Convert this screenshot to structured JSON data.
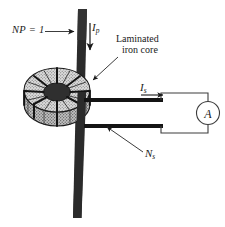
{
  "figure": {
    "background_color": "#ffffff",
    "ink_color": "#1a1a1a",
    "conductor_color": "#2b2b2b",
    "core_fill_color": "#d9d9d9",
    "width": 225,
    "height": 227
  },
  "labels": {
    "primary_turns": {
      "text": "NP = 1",
      "note": "number of primary turns, points to vertical primary conductor"
    },
    "primary_current": {
      "symbol": "I",
      "subscript": "p",
      "note": "primary current, downward arrow along the bar"
    },
    "core": {
      "line1": "Laminated",
      "line2": "iron core",
      "note": "leader arrow to top of toroid"
    },
    "secondary_current": {
      "symbol": "I",
      "subscript": "s",
      "note": "secondary current, rightward arrow on upper lead"
    },
    "secondary_turns": {
      "symbol": "N",
      "subscript": "s",
      "note": "secondary winding turns, leader arrow to toroid"
    },
    "ammeter": {
      "text": "A",
      "note": "ammeter symbol, circled italic A"
    }
  },
  "icons": {
    "arrow_primary": "down-arrow-icon",
    "arrow_secondary": "right-arrow-icon",
    "leader_np": "right-arrow-icon",
    "leader_core": "leader-arrow-icon",
    "leader_ns": "leader-arrow-icon",
    "ammeter": "ammeter-icon"
  }
}
